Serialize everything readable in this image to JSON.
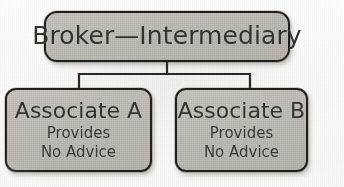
{
  "figure": {
    "type": "organizational-chart",
    "orientation": "top-down",
    "background_color": "#fcfbfa",
    "node_fill_color": "#c2bfb9",
    "node_border_color": "#22201e",
    "text_color": "#35322e"
  },
  "nodes": {
    "root": {
      "id": "broker-intermediary",
      "label": "Broker—Intermediary",
      "level": 0
    },
    "children": [
      {
        "id": "associate-a",
        "heading": "Associate A",
        "line2": "Provides",
        "line3": "No Advice",
        "level": 1
      },
      {
        "id": "associate-b",
        "heading": "Associate B",
        "line2": "Provides",
        "line3": "No Advice",
        "level": 1
      }
    ]
  },
  "connectors": {
    "style": "elbow",
    "line_color": "#2a2825",
    "from": "broker-intermediary",
    "to": [
      "associate-a",
      "associate-b"
    ]
  }
}
